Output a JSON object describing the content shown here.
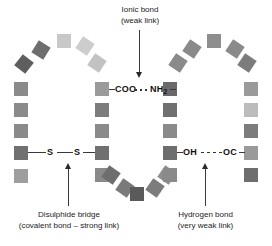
{
  "diagram": {
    "title_hidden": "",
    "annotations": [
      {
        "id": "ionic",
        "line1": "Ionic bond",
        "line2": "(weak link)",
        "x": 140,
        "y": 4,
        "arrow": "down"
      },
      {
        "id": "disulphide",
        "line1": "Disulphide bridge",
        "line2": "(covalent bond – strong link)",
        "x": 76,
        "y": 208,
        "arrow": "up"
      },
      {
        "id": "hydrogen",
        "line1": "Hydrogen bond",
        "line2": "(very weak link)",
        "x": 205,
        "y": 208,
        "arrow": "up"
      }
    ],
    "bonds": [
      {
        "id": "ionic-bond",
        "left_group": "COO",
        "right_group": "NH",
        "right_sub": "2",
        "connector": "dotted",
        "y": 85
      },
      {
        "id": "disulphide-bond",
        "left_group": "S",
        "right_group": "S",
        "connector": "solid",
        "y": 146
      },
      {
        "id": "hydrogen-bond",
        "left_group": "OH",
        "right_group": "OC",
        "connector": "dashed",
        "y": 146
      }
    ],
    "colors": {
      "dark": "#5a5a5a",
      "medium_dark": "#707070",
      "medium": "#8a8a8a",
      "light": "#b4b4b4",
      "lighter": "#c8c8c8",
      "lightest": "#d8d8d8",
      "line": "#3a3a3a",
      "text": "#1c1c1c",
      "background": "#ffffff"
    },
    "amino_acid_residues": [
      {
        "id": "r01",
        "x": 14,
        "y": 169,
        "rot": 0,
        "color": "#9e9e9e",
        "chain": "left-column"
      },
      {
        "id": "r02",
        "x": 14,
        "y": 146,
        "rot": 0,
        "color": "#707070",
        "chain": "left-column"
      },
      {
        "id": "r03",
        "x": 14,
        "y": 124,
        "rot": 0,
        "color": "#8a8a8a",
        "chain": "left-column"
      },
      {
        "id": "r04",
        "x": 14,
        "y": 103,
        "rot": 0,
        "color": "#8a8a8a",
        "chain": "left-column"
      },
      {
        "id": "r05",
        "x": 14,
        "y": 82,
        "rot": 0,
        "color": "#8a8a8a",
        "chain": "left-column"
      },
      {
        "id": "r06",
        "x": 17,
        "y": 57,
        "rot": 38,
        "color": "#5e5e5e",
        "chain": "left-arc"
      },
      {
        "id": "r07",
        "x": 34,
        "y": 43,
        "rot": 32,
        "color": "#6e6e6e",
        "chain": "left-arc"
      },
      {
        "id": "r08",
        "x": 57,
        "y": 34,
        "rot": 0,
        "color": "#c8c8c8",
        "chain": "left-arc"
      },
      {
        "id": "r09",
        "x": 78,
        "y": 39,
        "rot": 34,
        "color": "#cdcdcd",
        "chain": "left-arc"
      },
      {
        "id": "r10",
        "x": 90,
        "y": 56,
        "rot": 34,
        "color": "#c2c2c2",
        "chain": "left-arc"
      },
      {
        "id": "r11",
        "x": 95,
        "y": 82,
        "rot": 0,
        "color": "#9a9a9a",
        "chain": "inner-left-column"
      },
      {
        "id": "r12",
        "x": 95,
        "y": 103,
        "rot": 0,
        "color": "#7c7c7c",
        "chain": "inner-left-column"
      },
      {
        "id": "r13",
        "x": 95,
        "y": 124,
        "rot": 0,
        "color": "#8a8a8a",
        "chain": "inner-left-column"
      },
      {
        "id": "r14",
        "x": 95,
        "y": 146,
        "rot": 0,
        "color": "#707070",
        "chain": "inner-left-column"
      },
      {
        "id": "r15",
        "x": 95,
        "y": 168,
        "rot": 0,
        "color": "#8a8a8a",
        "chain": "inner-left-column"
      },
      {
        "id": "r16",
        "x": 104,
        "y": 168,
        "rot": 35,
        "color": "#6e6e6e",
        "chain": "bottom-arc"
      },
      {
        "id": "r17",
        "x": 118,
        "y": 181,
        "rot": 35,
        "color": "#7a7a7a",
        "chain": "bottom-arc"
      },
      {
        "id": "r18",
        "x": 130,
        "y": 187,
        "rot": 0,
        "color": "#5a5a5a",
        "chain": "bottom-arc"
      },
      {
        "id": "r19",
        "x": 148,
        "y": 181,
        "rot": 35,
        "color": "#7c7c7c",
        "chain": "bottom-arc"
      },
      {
        "id": "r20",
        "x": 160,
        "y": 168,
        "rot": 35,
        "color": "#8e8e8e",
        "chain": "bottom-arc"
      },
      {
        "id": "r21",
        "x": 163,
        "y": 168,
        "rot": 0,
        "color": "#8a8a8a",
        "chain": "inner-right-column"
      },
      {
        "id": "r22",
        "x": 163,
        "y": 146,
        "rot": 0,
        "color": "#6e6e6e",
        "chain": "inner-right-column"
      },
      {
        "id": "r23",
        "x": 163,
        "y": 124,
        "rot": 0,
        "color": "#8a8a8a",
        "chain": "inner-right-column"
      },
      {
        "id": "r24",
        "x": 163,
        "y": 103,
        "rot": 0,
        "color": "#707070",
        "chain": "inner-right-column"
      },
      {
        "id": "r25",
        "x": 163,
        "y": 82,
        "rot": 0,
        "color": "#6a6a6a",
        "chain": "inner-right-column"
      },
      {
        "id": "r26",
        "x": 171,
        "y": 56,
        "rot": 34,
        "color": "#8a8a8a",
        "chain": "right-arc"
      },
      {
        "id": "r27",
        "x": 185,
        "y": 42,
        "rot": 34,
        "color": "#8a8a8a",
        "chain": "right-arc"
      },
      {
        "id": "r28",
        "x": 207,
        "y": 34,
        "rot": 0,
        "color": "#8e8e8e",
        "chain": "right-arc"
      },
      {
        "id": "r29",
        "x": 228,
        "y": 42,
        "rot": 34,
        "color": "#8a8a8a",
        "chain": "right-arc"
      },
      {
        "id": "r30",
        "x": 240,
        "y": 56,
        "rot": 34,
        "color": "#7c7c7c",
        "chain": "right-arc"
      },
      {
        "id": "r31",
        "x": 244,
        "y": 82,
        "rot": 0,
        "color": "#9a9a9a",
        "chain": "right-column"
      },
      {
        "id": "r32",
        "x": 244,
        "y": 103,
        "rot": 0,
        "color": "#bcbcbc",
        "chain": "right-column"
      },
      {
        "id": "r33",
        "x": 244,
        "y": 124,
        "rot": 0,
        "color": "#7c7c7c",
        "chain": "right-column"
      },
      {
        "id": "r34",
        "x": 244,
        "y": 146,
        "rot": 0,
        "color": "#9a9a9a",
        "chain": "right-column"
      },
      {
        "id": "r35",
        "x": 244,
        "y": 168,
        "rot": 0,
        "color": "#6e6e6e",
        "chain": "right-column"
      }
    ]
  }
}
